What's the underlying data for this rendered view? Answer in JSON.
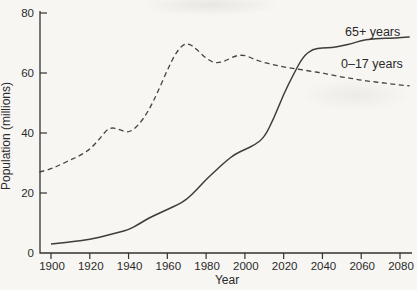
{
  "chart_data": {
    "type": "line",
    "title": "",
    "xlabel": "Year",
    "ylabel": "Population (millions)",
    "xticks": [
      1900,
      1920,
      1940,
      1960,
      1980,
      2000,
      2020,
      2040,
      2060,
      2080
    ],
    "yticks": [
      0,
      20,
      40,
      60,
      80
    ],
    "xlim": [
      1894,
      2086
    ],
    "ylim": [
      0,
      80
    ],
    "grid": false,
    "legend_position": "inline-right",
    "series": [
      {
        "name": "65+ years",
        "style": "solid",
        "color": "#3d3d3b",
        "x": [
          1900,
          1905,
          1910,
          1915,
          1920,
          1925,
          1930,
          1935,
          1940,
          1945,
          1950,
          1955,
          1960,
          1965,
          1970,
          1975,
          1980,
          1985,
          1990,
          1995,
          2000,
          2005,
          2010,
          2015,
          2020,
          2025,
          2030,
          2035,
          2040,
          2045,
          2050,
          2055,
          2060,
          2065,
          2070,
          2075,
          2080,
          2085
        ],
        "values": [
          3.0,
          3.3,
          3.7,
          4.1,
          4.6,
          5.3,
          6.1,
          6.9,
          7.8,
          9.5,
          11.5,
          13.0,
          14.5,
          16.0,
          17.8,
          21.0,
          24.5,
          27.5,
          30.5,
          33.0,
          34.5,
          36.0,
          38.5,
          45.0,
          53.0,
          59.5,
          65.5,
          68.0,
          68.3,
          68.5,
          69.0,
          69.8,
          70.8,
          71.3,
          71.5,
          71.6,
          71.8,
          72.0
        ]
      },
      {
        "name": "0–17 years",
        "style": "dashed",
        "color": "#45443f",
        "x": [
          1894,
          1900,
          1905,
          1910,
          1915,
          1920,
          1925,
          1930,
          1935,
          1940,
          1945,
          1950,
          1955,
          1960,
          1965,
          1970,
          1975,
          1980,
          1985,
          1990,
          1995,
          2000,
          2005,
          2010,
          2015,
          2020,
          2025,
          2030,
          2035,
          2040,
          2045,
          2050,
          2055,
          2060,
          2065,
          2070,
          2075,
          2080,
          2085
        ],
        "values": [
          27.0,
          28.0,
          29.5,
          31.0,
          32.5,
          34.5,
          38.0,
          42.0,
          41.2,
          40.0,
          42.5,
          47.0,
          53.5,
          61.0,
          67.5,
          70.3,
          68.0,
          64.8,
          63.2,
          64.0,
          65.8,
          66.0,
          64.5,
          63.5,
          62.7,
          62.0,
          61.5,
          61.0,
          60.5,
          60.0,
          59.3,
          58.7,
          58.2,
          57.6,
          57.2,
          56.8,
          56.4,
          56.0,
          55.7
        ]
      }
    ]
  },
  "colors": {
    "background": "#f7f6f3",
    "axis": "#333331",
    "text": "#2a2a2a"
  }
}
